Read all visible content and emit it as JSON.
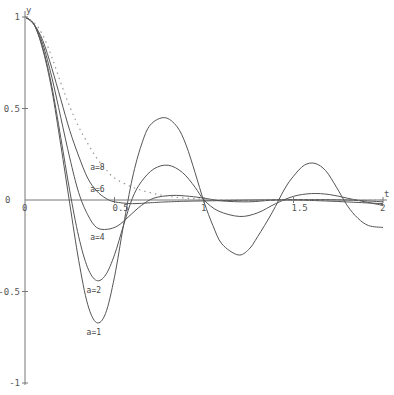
{
  "chart_data": {
    "type": "line",
    "title": "",
    "xlabel": "t",
    "ylabel": "y",
    "xlim": [
      0,
      2
    ],
    "ylim": [
      -1,
      1
    ],
    "grid": false,
    "legend": "inline labels",
    "x_ticks": [
      {
        "value": 0,
        "label": "0"
      },
      {
        "value": 0.5,
        "label": "0.5"
      },
      {
        "value": 1,
        "label": "1"
      },
      {
        "value": 1.5,
        "label": "1.5"
      },
      {
        "value": 2,
        "label": "2"
      }
    ],
    "y_ticks": [
      {
        "value": 1,
        "label": "1"
      },
      {
        "value": 0.5,
        "label": "0.5"
      },
      {
        "value": 0,
        "label": "0"
      },
      {
        "value": -0.5,
        "label": "-0.5"
      },
      {
        "value": -1,
        "label": "-1"
      }
    ],
    "series": [
      {
        "name": "a=1",
        "style": "solid",
        "label_at": [
          0.4,
          -0.72
        ],
        "points": [
          [
            0,
            1
          ],
          [
            0.05,
            0.96
          ],
          [
            0.1,
            0.82
          ],
          [
            0.15,
            0.6
          ],
          [
            0.2,
            0.3
          ],
          [
            0.25,
            -0.02
          ],
          [
            0.3,
            -0.33
          ],
          [
            0.35,
            -0.57
          ],
          [
            0.4,
            -0.67
          ],
          [
            0.45,
            -0.62
          ],
          [
            0.5,
            -0.42
          ],
          [
            0.55,
            -0.14
          ],
          [
            0.6,
            0.12
          ],
          [
            0.65,
            0.3
          ],
          [
            0.7,
            0.41
          ],
          [
            0.78,
            0.45
          ],
          [
            0.85,
            0.4
          ],
          [
            0.9,
            0.3
          ],
          [
            0.95,
            0.15
          ],
          [
            1.0,
            -0.01
          ],
          [
            1.05,
            -0.14
          ],
          [
            1.1,
            -0.24
          ],
          [
            1.19,
            -0.3
          ],
          [
            1.25,
            -0.27
          ],
          [
            1.3,
            -0.2
          ],
          [
            1.38,
            -0.07
          ],
          [
            1.45,
            0.06
          ],
          [
            1.5,
            0.13
          ],
          [
            1.56,
            0.19
          ],
          [
            1.62,
            0.2
          ],
          [
            1.68,
            0.16
          ],
          [
            1.74,
            0.07
          ],
          [
            1.8,
            -0.03
          ],
          [
            1.86,
            -0.1
          ],
          [
            1.92,
            -0.14
          ],
          [
            2.0,
            -0.15
          ]
        ]
      },
      {
        "name": "a=2",
        "style": "solid",
        "label_at": [
          0.4,
          -0.49
        ],
        "points": [
          [
            0,
            1
          ],
          [
            0.05,
            0.96
          ],
          [
            0.1,
            0.83
          ],
          [
            0.15,
            0.62
          ],
          [
            0.2,
            0.34
          ],
          [
            0.25,
            0.05
          ],
          [
            0.3,
            -0.2
          ],
          [
            0.35,
            -0.37
          ],
          [
            0.4,
            -0.44
          ],
          [
            0.45,
            -0.41
          ],
          [
            0.5,
            -0.3
          ],
          [
            0.55,
            -0.14
          ],
          [
            0.6,
            0.01
          ],
          [
            0.65,
            0.1
          ],
          [
            0.72,
            0.17
          ],
          [
            0.8,
            0.19
          ],
          [
            0.88,
            0.15
          ],
          [
            0.95,
            0.07
          ],
          [
            1.0,
            0.0
          ],
          [
            1.08,
            -0.06
          ],
          [
            1.2,
            -0.09
          ],
          [
            1.3,
            -0.07
          ],
          [
            1.4,
            -0.02
          ],
          [
            1.5,
            0.02
          ],
          [
            1.6,
            0.035
          ],
          [
            1.7,
            0.03
          ],
          [
            1.8,
            0.01
          ],
          [
            1.9,
            -0.01
          ],
          [
            2.0,
            -0.03
          ]
        ]
      },
      {
        "name": "a=4",
        "style": "solid",
        "label_at": [
          0.42,
          -0.2
        ],
        "points": [
          [
            0,
            1
          ],
          [
            0.05,
            0.96
          ],
          [
            0.1,
            0.85
          ],
          [
            0.15,
            0.67
          ],
          [
            0.2,
            0.45
          ],
          [
            0.25,
            0.23
          ],
          [
            0.3,
            0.04
          ],
          [
            0.35,
            -0.08
          ],
          [
            0.4,
            -0.15
          ],
          [
            0.46,
            -0.16
          ],
          [
            0.52,
            -0.14
          ],
          [
            0.58,
            -0.09
          ],
          [
            0.65,
            -0.03
          ],
          [
            0.72,
            0.01
          ],
          [
            0.82,
            0.025
          ],
          [
            0.92,
            0.02
          ],
          [
            1.0,
            0.01
          ],
          [
            1.1,
            -0.005
          ],
          [
            1.25,
            -0.01
          ],
          [
            1.4,
            0.0
          ],
          [
            1.6,
            0.002
          ],
          [
            1.8,
            0.0
          ],
          [
            2.0,
            -0.01
          ]
        ]
      },
      {
        "name": "a=6",
        "style": "solid",
        "label_at": [
          0.42,
          0.06
        ],
        "points": [
          [
            0,
            1
          ],
          [
            0.05,
            0.96
          ],
          [
            0.1,
            0.87
          ],
          [
            0.15,
            0.72
          ],
          [
            0.2,
            0.55
          ],
          [
            0.25,
            0.38
          ],
          [
            0.3,
            0.24
          ],
          [
            0.35,
            0.12
          ],
          [
            0.4,
            0.05
          ],
          [
            0.45,
            0.01
          ],
          [
            0.5,
            -0.01
          ],
          [
            0.6,
            -0.02
          ],
          [
            0.7,
            -0.015
          ],
          [
            0.8,
            -0.01
          ],
          [
            1.0,
            -0.005
          ],
          [
            1.5,
            0.0
          ],
          [
            2.0,
            -0.02
          ]
        ]
      },
      {
        "name": "a=8",
        "style": "dotted",
        "label_at": [
          0.42,
          0.18
        ],
        "points": [
          [
            0,
            1
          ],
          [
            0.05,
            0.97
          ],
          [
            0.1,
            0.9
          ],
          [
            0.15,
            0.78
          ],
          [
            0.2,
            0.64
          ],
          [
            0.25,
            0.51
          ],
          [
            0.3,
            0.4
          ],
          [
            0.35,
            0.31
          ],
          [
            0.4,
            0.23
          ],
          [
            0.45,
            0.17
          ],
          [
            0.5,
            0.12
          ],
          [
            0.6,
            0.07
          ],
          [
            0.7,
            0.04
          ],
          [
            0.8,
            0.02
          ],
          [
            0.9,
            0.01
          ],
          [
            1.0,
            0.005
          ],
          [
            1.2,
            0.0
          ],
          [
            1.5,
            0.0
          ],
          [
            2.0,
            0.0
          ]
        ]
      }
    ]
  },
  "axes": {
    "x_axis_label": "t",
    "y_axis_label": "y"
  }
}
